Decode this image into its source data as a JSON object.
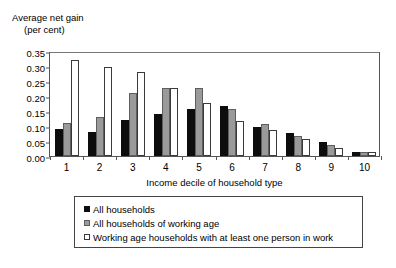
{
  "chart_data": {
    "type": "bar",
    "title": "",
    "ylabel_line1": "Average net gain",
    "ylabel_line2": "(per cent)",
    "xlabel": "Income decile of household type",
    "ylim": [
      0.0,
      0.35
    ],
    "ytick_labels": [
      "0.35",
      "0.30",
      "0.25",
      "0.20",
      "0.15",
      "0.10",
      "0.05",
      "0.00"
    ],
    "ytick_values": [
      0.35,
      0.3,
      0.25,
      0.2,
      0.15,
      0.1,
      0.05,
      0.0
    ],
    "grid": false,
    "legend_position": "below-plot",
    "categories": [
      "1",
      "2",
      "3",
      "4",
      "5",
      "6",
      "7",
      "8",
      "9",
      "10"
    ],
    "series": [
      {
        "name": "All households",
        "color": "#0d0d0d",
        "values": [
          0.09,
          0.08,
          0.12,
          0.139,
          0.157,
          0.168,
          0.098,
          0.078,
          0.047,
          0.015
        ]
      },
      {
        "name": "All households of working age",
        "color": "#9a9a9a",
        "values": [
          0.11,
          0.13,
          0.21,
          0.227,
          0.227,
          0.157,
          0.108,
          0.067,
          0.037,
          0.014
        ]
      },
      {
        "name": "Working age households with at least one person in work",
        "color": "#ffffff",
        "values": [
          0.32,
          0.298,
          0.28,
          0.227,
          0.178,
          0.118,
          0.088,
          0.057,
          0.027,
          0.015
        ]
      }
    ]
  },
  "legend": {
    "items": [
      {
        "label": "All households",
        "swatch": "black-square-swatch"
      },
      {
        "label": "All households of working age",
        "swatch": "gray-square-swatch"
      },
      {
        "label": "Working age households with at least one person in work",
        "swatch": "white-square-swatch"
      }
    ]
  }
}
